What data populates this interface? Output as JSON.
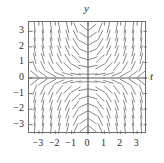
{
  "figure": {
    "kind": "slope-field",
    "axis_titles": {
      "x": "t",
      "y": "y"
    },
    "frame_color": "#6b6b6b",
    "axis_color": "#555555",
    "segment_color": "#8a8a8a",
    "tick_label_color": "#2b2b2b"
  },
  "chart_data": {
    "type": "scatter",
    "title": "",
    "xlabel": "t",
    "ylabel": "y",
    "xlim": [
      -3.6,
      3.6
    ],
    "ylim": [
      -3.6,
      3.6
    ],
    "grid": false,
    "legend": null,
    "xticks": [
      -3,
      -2,
      -1,
      0,
      1,
      2,
      3
    ],
    "xticklabels": [
      "-3",
      "-2",
      "-1",
      "0",
      "1",
      "2",
      "3"
    ],
    "yticks": [
      -3,
      -2,
      -1,
      0,
      1,
      2,
      3
    ],
    "yticklabels": [
      "-3",
      "-2",
      "-1",
      "0",
      "1",
      "2",
      "3"
    ],
    "slope_formula": "dy/dt = t*y",
    "sample_step": 0.5,
    "sample_range": [
      -3.25,
      3.25
    ],
    "zero_slope_loci": [
      "t = 0",
      "y = 0"
    ],
    "segments_per_axis": 14,
    "x": [
      -3.25,
      -2.75,
      -2.25,
      -1.75,
      -1.25,
      -0.75,
      -0.25,
      0.25,
      0.75,
      1.25,
      1.75,
      2.25,
      2.75,
      3.25
    ],
    "y": [
      -3.25,
      -2.75,
      -2.25,
      -1.75,
      -1.25,
      -0.75,
      -0.25,
      0.25,
      0.75,
      1.25,
      1.75,
      2.25,
      2.75,
      3.25
    ]
  }
}
